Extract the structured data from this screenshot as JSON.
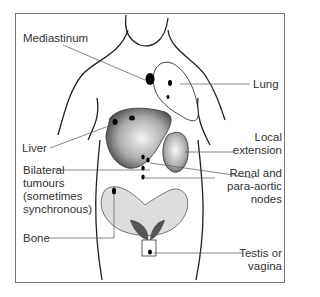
{
  "figure": {
    "labels": {
      "mediastinum": "Mediastinum",
      "lung": "Lung",
      "liver": "Liver",
      "local_extension": "Local\nextension",
      "bilateral": "Bilateral\ntumours\n(sometimes\nsynchronous)",
      "renal": "Renal and\npara-aortic\nnodes",
      "bone": "Bone",
      "testis": "Testis or\nvagina"
    }
  }
}
